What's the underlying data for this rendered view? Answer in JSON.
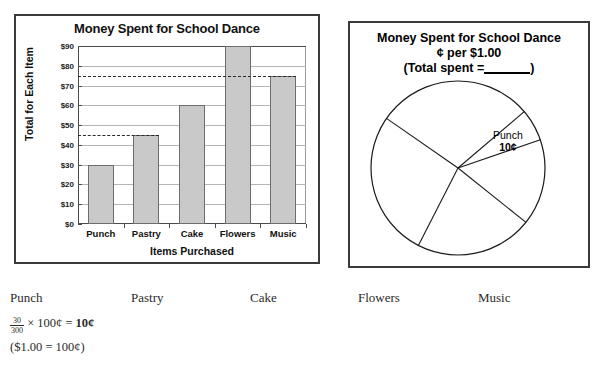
{
  "bar_panel": {
    "title": "Money Spent for School Dance",
    "ylabel": "Total for Each Item",
    "xlabel": "Items Purchased"
  },
  "pie_panel": {
    "title_line1": "Money Spent for School Dance",
    "title_line2": "¢ per $1.00",
    "title_line3_pre": "(Total spent =",
    "title_line3_post": ")",
    "punch_label": "Punch",
    "punch_amount": "10¢"
  },
  "worksheet": {
    "items": [
      "Punch",
      "Pastry",
      "Cake",
      "Flowers",
      "Music"
    ],
    "formula_num": "30",
    "formula_den": "300",
    "formula_times": "× 100¢ =",
    "formula_result": "10¢",
    "note": "($1.00 = 100¢)"
  },
  "chart_data": [
    {
      "type": "bar",
      "title": "Money Spent for School Dance",
      "xlabel": "Items Purchased",
      "ylabel": "Total for Each Item",
      "categories": [
        "Punch",
        "Pastry",
        "Cake",
        "Flowers",
        "Music"
      ],
      "values": [
        30,
        45,
        60,
        90,
        75
      ],
      "ylim": [
        0,
        90
      ],
      "yticks": [
        0,
        10,
        20,
        30,
        40,
        50,
        60,
        70,
        80,
        90
      ],
      "ytick_labels": [
        "$0",
        "$10",
        "$20",
        "$30",
        "$40",
        "$50",
        "$60",
        "$70",
        "$80",
        "$90"
      ],
      "grid": true,
      "legend": "none",
      "annotations": [
        {
          "type": "dashed-line",
          "value": 75,
          "from": "axis",
          "to": "Music"
        },
        {
          "type": "dashed-line",
          "value": 45,
          "from": "axis",
          "to": "Pastry"
        }
      ],
      "bar_fill": "#c9c9c9",
      "bar_stroke": "#6d6d6d"
    },
    {
      "type": "pie",
      "title": "Money Spent for School Dance ¢ per $1.00 (Total spent =____)",
      "labels": [
        "Punch",
        "Pastry",
        "Cake",
        "Flowers",
        "Music"
      ],
      "values": [
        10,
        15,
        20,
        30,
        25
      ],
      "unit": "¢ per $1.00",
      "labelled_slices": [
        {
          "label": "Punch",
          "value": "10¢"
        }
      ],
      "fill": "#ffffff",
      "stroke": "#000000"
    }
  ]
}
